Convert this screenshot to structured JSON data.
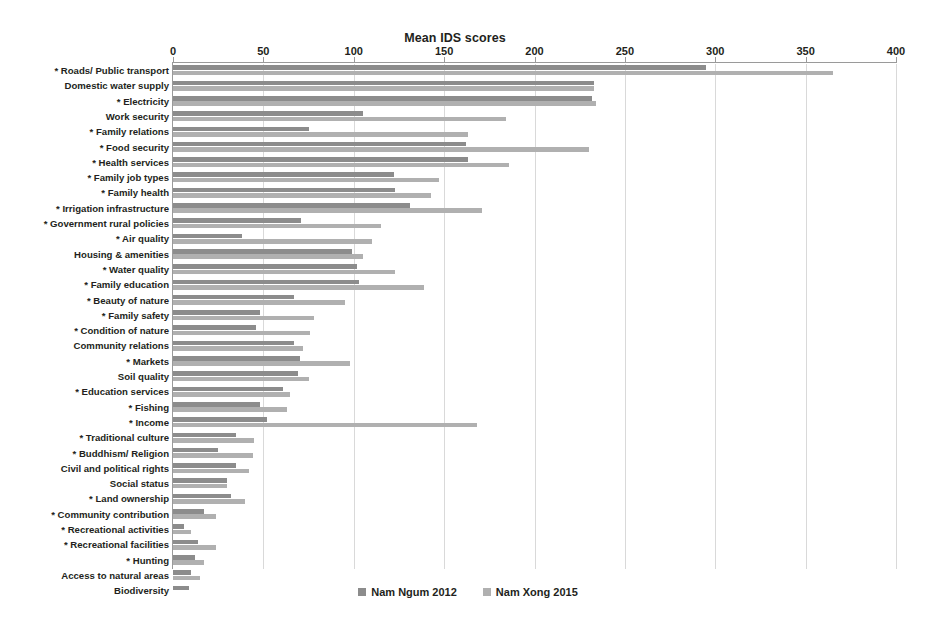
{
  "chart_data": {
    "type": "bar",
    "orientation": "horizontal",
    "title": "Mean IDS scores",
    "xlabel": "",
    "ylabel": "",
    "xlim": [
      0,
      400
    ],
    "xticks": [
      0,
      50,
      100,
      150,
      200,
      250,
      300,
      350,
      400
    ],
    "xtick_labels": [
      "0",
      "50",
      "100",
      "150",
      "200",
      "250",
      "300",
      "350",
      "400"
    ],
    "grid": true,
    "legend_position": "bottom",
    "categories": [
      "* Roads/ Public transport",
      "Domestic water supply",
      "* Electricity",
      "Work  security",
      "* Family relations",
      "* Food security",
      "* Health services",
      "* Family job types",
      "* Family health",
      "* Irrigation infrastructure",
      "* Government rural policies",
      "* Air quality",
      "Housing & amenities",
      "* Water quality",
      "* Family education",
      "* Beauty of nature",
      "* Family safety",
      "* Condition of nature",
      "Community relations",
      "* Markets",
      "Soil quality",
      "* Education services",
      "* Fishing",
      "* Income",
      "* Traditional culture",
      "* Buddhism/ Religion",
      "Civil and political rights",
      "Social status",
      "* Land ownership",
      "* Community contribution",
      "* Recreational activities",
      "* Recreational facilities",
      "* Hunting",
      "Access to natural areas",
      "Biodiversity"
    ],
    "series": [
      {
        "name": "Nam Ngum 2012",
        "color": "#8c8c8c",
        "values": [
          295,
          233,
          232,
          105,
          75,
          162,
          163,
          122,
          123,
          131,
          71,
          38,
          99,
          102,
          103,
          67,
          48,
          46,
          67,
          70,
          69,
          61,
          48,
          52,
          35,
          25,
          35,
          30,
          32,
          17,
          6,
          14,
          12,
          10,
          9
        ]
      },
      {
        "name": "Nam Xong 2015",
        "color": "#b0b0b0",
        "values": [
          365,
          233,
          234,
          184,
          163,
          230,
          186,
          147,
          143,
          171,
          115,
          110,
          105,
          123,
          139,
          95,
          78,
          76,
          72,
          98,
          75,
          65,
          63,
          168,
          45,
          44,
          42,
          30,
          40,
          24,
          10,
          24,
          17,
          15,
          0
        ]
      }
    ]
  },
  "legend": {
    "items": [
      {
        "label": "Nam Ngum 2012",
        "color": "#8c8c8c"
      },
      {
        "label": "Nam Xong 2015",
        "color": "#b0b0b0"
      }
    ]
  }
}
